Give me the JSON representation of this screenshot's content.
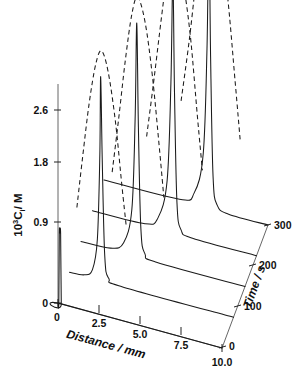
{
  "figure": {
    "type": "3d-waterfall-line-plot",
    "background_color": "#ffffff",
    "line_color": "#1a1a1a",
    "axis_color": "#222222"
  },
  "chart_data": {
    "type": "line",
    "title": "",
    "subtitle": "",
    "projection": "3d-waterfall",
    "xlabel": "Distance/mm",
    "ylabel": "10³Cᵢ/M",
    "zlabel": "Time/s",
    "xlim": [
      0,
      10.0
    ],
    "ylim": [
      0,
      2.9
    ],
    "zlim": [
      0,
      300
    ],
    "xticks": [
      "0",
      "2.5",
      "5.0",
      "7.5",
      "10.0"
    ],
    "xtick_values": [
      0,
      2.5,
      5.0,
      7.5,
      10.0
    ],
    "yticks": [
      "0",
      "0.9",
      "1.8",
      "2.6"
    ],
    "ytick_values": [
      0,
      0.9,
      1.8,
      2.6
    ],
    "zticks": [
      "0",
      "100",
      "200",
      "300"
    ],
    "ztick_values": [
      0,
      100,
      200,
      300
    ],
    "grid": false,
    "legend": false,
    "legend_position": "none",
    "annotations": [],
    "series": [
      {
        "name": "t = 0 s (solid)",
        "style": "solid",
        "time": 0,
        "peak_position_mm": 0.12,
        "peak_height": 0.95,
        "peak_width_mm": 0.18,
        "baseline_value": 0.0,
        "points_x": [
          0.0,
          0.05,
          0.08,
          0.12,
          0.16,
          0.2,
          0.25,
          10.0
        ],
        "points_y": [
          0.0,
          0.0,
          0.95,
          0.95,
          0.95,
          0.0,
          0.0,
          0.0
        ]
      },
      {
        "name": "t = 75 s (solid)",
        "style": "solid",
        "time": 75,
        "peak_position_mm": 1.9,
        "peak_height": 2.75,
        "peak_width_mm": 0.35,
        "baseline_value": 0.0,
        "points_x": [
          0.0,
          0.9,
          1.4,
          1.7,
          1.85,
          1.9,
          2.0,
          2.15,
          2.4,
          3.2,
          10.0
        ],
        "points_y": [
          0.0,
          0.02,
          0.12,
          0.55,
          1.7,
          2.75,
          1.6,
          0.35,
          0.06,
          0.0,
          0.0
        ]
      },
      {
        "name": "t = 75 s (dashed)",
        "style": "dashed",
        "time": 75,
        "peak_position_mm": 1.95,
        "peak_height": 3.1,
        "peak_width_mm": 1.5,
        "baseline_value": 0.0,
        "points_x": [
          0.45,
          0.8,
          1.2,
          1.6,
          1.95,
          2.35,
          2.8,
          3.2,
          3.45
        ],
        "points_y": [
          0.9,
          1.6,
          2.35,
          2.9,
          3.1,
          2.85,
          2.2,
          1.35,
          0.85
        ]
      },
      {
        "name": "t = 150 s (solid)",
        "style": "solid",
        "time": 150,
        "peak_position_mm": 3.4,
        "peak_height": 3.15,
        "peak_width_mm": 0.32,
        "baseline_value": 0.0,
        "points_x": [
          0.0,
          1.8,
          2.6,
          3.1,
          3.3,
          3.4,
          3.5,
          3.65,
          3.9,
          4.6,
          10.0
        ],
        "points_y": [
          0.0,
          0.02,
          0.14,
          0.62,
          1.85,
          3.15,
          1.75,
          0.4,
          0.07,
          0.0,
          0.0
        ]
      },
      {
        "name": "t = 150 s (dashed)",
        "style": "dashed",
        "time": 150,
        "peak_position_mm": 3.45,
        "peak_height": 3.5,
        "peak_width_mm": 1.6,
        "baseline_value": 0.0,
        "points_x": [
          1.9,
          2.3,
          2.7,
          3.1,
          3.45,
          3.9,
          4.35,
          4.8,
          5.05
        ],
        "points_y": [
          1.05,
          1.8,
          2.6,
          3.25,
          3.5,
          3.2,
          2.5,
          1.5,
          0.9
        ]
      },
      {
        "name": "t = 225 s (solid)",
        "style": "solid",
        "time": 225,
        "peak_position_mm": 4.9,
        "peak_height": 3.45,
        "peak_width_mm": 0.3,
        "baseline_value": 0.0,
        "points_x": [
          0.0,
          3.2,
          4.0,
          4.55,
          4.78,
          4.9,
          5.0,
          5.15,
          5.4,
          6.1,
          10.0
        ],
        "points_y": [
          0.0,
          0.02,
          0.15,
          0.68,
          2.0,
          3.45,
          1.9,
          0.42,
          0.07,
          0.0,
          0.0
        ]
      },
      {
        "name": "t = 225 s (dashed)",
        "style": "dashed",
        "time": 225,
        "peak_position_mm": 4.95,
        "peak_height": 3.85,
        "peak_width_mm": 1.7,
        "baseline_value": 0.0,
        "points_x": [
          3.3,
          3.75,
          4.2,
          4.6,
          4.95,
          5.45,
          5.95,
          6.4,
          6.7
        ],
        "points_y": [
          1.2,
          2.0,
          2.85,
          3.55,
          3.85,
          3.5,
          2.75,
          1.65,
          0.95
        ]
      },
      {
        "name": "t = 300 s (solid)",
        "style": "solid",
        "time": 300,
        "peak_position_mm": 6.4,
        "peak_height": 3.8,
        "peak_width_mm": 0.3,
        "baseline_value": 0.0,
        "points_x": [
          0.0,
          4.6,
          5.5,
          6.05,
          6.28,
          6.4,
          6.5,
          6.65,
          6.9,
          7.6,
          10.0
        ],
        "points_y": [
          0.0,
          0.02,
          0.16,
          0.72,
          2.15,
          3.8,
          2.05,
          0.45,
          0.08,
          0.0,
          0.0
        ]
      },
      {
        "name": "t = 300 s (dashed)",
        "style": "dashed",
        "time": 300,
        "peak_position_mm": 6.45,
        "peak_height": 4.2,
        "peak_width_mm": 1.8,
        "baseline_value": 0.0,
        "points_x": [
          4.7,
          5.2,
          5.65,
          6.1,
          6.45,
          6.95,
          7.5,
          8.0,
          8.3
        ],
        "points_y": [
          1.35,
          2.2,
          3.1,
          3.85,
          4.2,
          3.8,
          3.0,
          1.8,
          1.05
        ]
      }
    ]
  },
  "labels": {
    "y_axis_prefix": "10",
    "y_axis_sup": "3",
    "y_axis_mid": "C",
    "y_axis_sub": "i",
    "y_axis_suffix": "/ M",
    "x_axis_title": "Distance / mm",
    "z_axis_title": "Time / s",
    "x_ticks": [
      "0",
      "2.5",
      "5.0",
      "7.5",
      "10.0"
    ],
    "y_ticks": [
      "2.6",
      "1.8",
      "0.9",
      "0"
    ],
    "z_ticks": [
      "300",
      "200",
      "100",
      "0"
    ]
  }
}
